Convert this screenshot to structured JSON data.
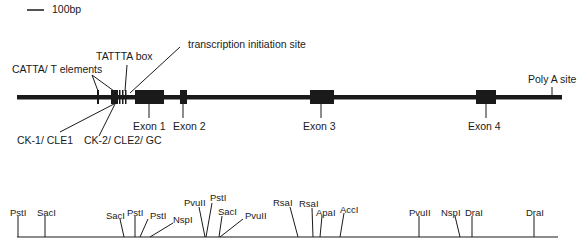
{
  "scale_bar": {
    "label": "100bp"
  },
  "gene_map": {
    "annotations": {
      "catta": "CATTA/ T elements",
      "tattta": "TATTTA box",
      "tis": "transcription initiation site",
      "polya": "Poly A site",
      "ck1": "CK-1/ CLE1",
      "ck2": "CK-2/ CLE2/ GC"
    },
    "exons": [
      {
        "label": "Exon 1"
      },
      {
        "label": "Exon 2"
      },
      {
        "label": "Exon 3"
      },
      {
        "label": "Exon 4"
      }
    ]
  },
  "restriction_map": {
    "sites": [
      {
        "label": "PstI"
      },
      {
        "label": "SacI"
      },
      {
        "label": "SacI"
      },
      {
        "label": "PstI"
      },
      {
        "label": "PstI"
      },
      {
        "label": "NspI"
      },
      {
        "label": "PvuII"
      },
      {
        "label": "PstI"
      },
      {
        "label": "SacI"
      },
      {
        "label": "PvuII"
      },
      {
        "label": "RsaI"
      },
      {
        "label": "RsaI"
      },
      {
        "label": "ApaI"
      },
      {
        "label": "AccI"
      },
      {
        "label": "PvuII"
      },
      {
        "label": "NspI"
      },
      {
        "label": "DraI"
      },
      {
        "label": "DraI"
      }
    ]
  }
}
